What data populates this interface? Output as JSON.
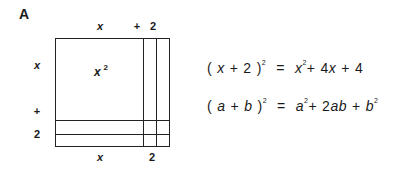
{
  "panel_label": "A",
  "diagram": {
    "top_labels": [
      "x",
      "+",
      "2"
    ],
    "left_labels": [
      "x",
      "+",
      "2"
    ],
    "bottom_labels": [
      "x",
      "2"
    ],
    "area_label": {
      "base": "x",
      "exp": "2"
    }
  },
  "equations": [
    {
      "lhs_open": "(",
      "lhs_a": "x",
      "lhs_plus": "+",
      "lhs_b": "2",
      "lhs_close": ")",
      "lhs_exp": "2",
      "eq": "=",
      "t1": "x",
      "t1_exp": "2",
      "p1": "+",
      "t2_coef": "4",
      "t2_var": "x",
      "p2": "+",
      "t3": "4"
    },
    {
      "lhs_open": "(",
      "lhs_a": "a",
      "lhs_plus": "+",
      "lhs_b": "b",
      "lhs_close": ")",
      "lhs_exp": "2",
      "eq": "=",
      "t1": "a",
      "t1_exp": "2",
      "p1": "+",
      "t2_coef": "2",
      "t2_var": "ab",
      "p2": "+",
      "t3": "b",
      "t3_exp": "2"
    }
  ]
}
